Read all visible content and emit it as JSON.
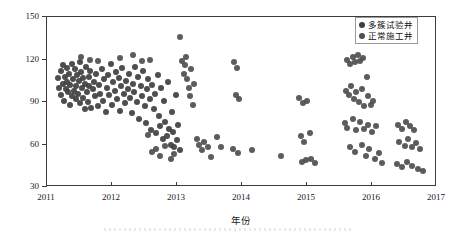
{
  "chart_data": {
    "type": "scatter",
    "title": "",
    "xlabel": "年份",
    "ylabel": "压裂段长/m",
    "xlim": [
      2011,
      2017
    ],
    "ylim": [
      30,
      150
    ],
    "xticks": [
      "2011",
      "2012",
      "2013",
      "2014",
      "2015",
      "2016",
      "2017"
    ],
    "xtick_values": [
      2011,
      2012,
      2013,
      2014,
      2015,
      2016,
      2017
    ],
    "yticks": [
      "30",
      "60",
      "90",
      "120",
      "150"
    ],
    "ytick_values": [
      30,
      60,
      90,
      120,
      150
    ],
    "grid": false,
    "legend_position": "top-right",
    "marker": {
      "shape": "circle",
      "size_px": 6,
      "color": "#4a4a4a",
      "opacity": 0.92
    },
    "series": [
      {
        "name": "多簇试验井",
        "color": "#3f3f3f",
        "points": [
          [
            2011.17,
            107
          ],
          [
            2011.19,
            100
          ],
          [
            2011.21,
            112
          ],
          [
            2011.22,
            95
          ],
          [
            2011.24,
            103
          ],
          [
            2011.25,
            116
          ],
          [
            2011.26,
            91
          ],
          [
            2011.28,
            108
          ],
          [
            2011.29,
            99
          ],
          [
            2011.3,
            114
          ],
          [
            2011.31,
            104
          ],
          [
            2011.33,
            97
          ],
          [
            2011.34,
            110
          ],
          [
            2011.35,
            88
          ],
          [
            2011.36,
            102
          ],
          [
            2011.38,
            117
          ],
          [
            2011.39,
            94
          ],
          [
            2011.4,
            106
          ],
          [
            2011.41,
            98
          ],
          [
            2011.43,
            113
          ],
          [
            2011.44,
            101
          ],
          [
            2011.45,
            92
          ],
          [
            2011.46,
            109
          ],
          [
            2011.48,
            96
          ],
          [
            2011.49,
            105
          ],
          [
            2011.5,
            118
          ],
          [
            2011.51,
            89
          ],
          [
            2011.53,
            111
          ],
          [
            2011.54,
            100
          ],
          [
            2011.55,
            93
          ],
          [
            2011.56,
            107
          ],
          [
            2011.58,
            85
          ],
          [
            2011.59,
            103
          ],
          [
            2011.6,
            115
          ],
          [
            2011.61,
            97
          ],
          [
            2011.63,
            90
          ],
          [
            2011.64,
            108
          ],
          [
            2011.65,
            101
          ],
          [
            2011.66,
            112
          ],
          [
            2011.68,
            86
          ],
          [
            2011.7,
            99
          ],
          [
            2011.72,
            104
          ],
          [
            2011.74,
            94
          ],
          [
            2011.76,
            110
          ],
          [
            2011.78,
            87
          ],
          [
            2011.8,
            102
          ],
          [
            2011.82,
            96
          ],
          [
            2011.84,
            113
          ],
          [
            2011.86,
            91
          ],
          [
            2011.88,
            106
          ],
          [
            2011.9,
            83
          ],
          [
            2011.92,
            100
          ],
          [
            2011.94,
            109
          ],
          [
            2011.96,
            95
          ],
          [
            2011.98,
            117
          ],
          [
            2012.0,
            88
          ],
          [
            2012.02,
            104
          ],
          [
            2012.04,
            98
          ],
          [
            2012.06,
            111
          ],
          [
            2012.08,
            92
          ],
          [
            2012.1,
            107
          ],
          [
            2012.12,
            84
          ],
          [
            2012.14,
            101
          ],
          [
            2012.16,
            114
          ],
          [
            2012.18,
            96
          ],
          [
            2012.2,
            89
          ],
          [
            2012.22,
            105
          ],
          [
            2012.24,
            99
          ],
          [
            2012.26,
            110
          ],
          [
            2012.28,
            93
          ],
          [
            2012.3,
            82
          ],
          [
            2012.32,
            103
          ],
          [
            2012.34,
            97
          ],
          [
            2012.36,
            115
          ],
          [
            2012.38,
            90
          ],
          [
            2012.4,
            108
          ],
          [
            2012.42,
            78
          ],
          [
            2012.44,
            101
          ],
          [
            2012.46,
            94
          ],
          [
            2012.48,
            112
          ],
          [
            2012.5,
            87
          ],
          [
            2012.52,
            75
          ],
          [
            2012.54,
            99
          ],
          [
            2012.56,
            106
          ],
          [
            2012.58,
            92
          ],
          [
            2012.6,
            70
          ],
          [
            2012.62,
            102
          ],
          [
            2012.64,
            85
          ],
          [
            2012.66,
            96
          ],
          [
            2012.68,
            68
          ],
          [
            2012.7,
            109
          ],
          [
            2012.72,
            80
          ],
          [
            2012.74,
            73
          ],
          [
            2012.76,
            100
          ],
          [
            2012.78,
            64
          ],
          [
            2012.8,
            91
          ],
          [
            2012.82,
            76
          ],
          [
            2012.84,
            66
          ],
          [
            2012.86,
            104
          ],
          [
            2012.88,
            71
          ],
          [
            2012.9,
            60
          ],
          [
            2012.92,
            83
          ],
          [
            2012.94,
            69
          ],
          [
            2012.96,
            58
          ],
          [
            2012.98,
            95
          ],
          [
            2013.0,
            63
          ],
          [
            2013.02,
            74
          ],
          [
            2013.04,
            56
          ]
        ]
      },
      {
        "name": "正常施工井",
        "color": "#4e4e4e",
        "points": [
          [
            2011.52,
            122
          ],
          [
            2011.66,
            120
          ],
          [
            2011.78,
            119
          ],
          [
            2012.12,
            121
          ],
          [
            2012.33,
            123
          ],
          [
            2012.46,
            119
          ],
          [
            2012.58,
            120
          ],
          [
            2012.55,
            67
          ],
          [
            2012.62,
            55
          ],
          [
            2012.68,
            57
          ],
          [
            2012.74,
            52
          ],
          [
            2012.82,
            59
          ],
          [
            2012.9,
            50
          ],
          [
            2012.96,
            53
          ],
          [
            2013.04,
            136
          ],
          [
            2013.08,
            119
          ],
          [
            2013.12,
            116
          ],
          [
            2013.14,
            122
          ],
          [
            2013.1,
            110
          ],
          [
            2013.16,
            106
          ],
          [
            2013.18,
            100
          ],
          [
            2013.2,
            94
          ],
          [
            2013.22,
            113
          ],
          [
            2013.24,
            88
          ],
          [
            2013.26,
            103
          ],
          [
            2013.3,
            64
          ],
          [
            2013.34,
            60
          ],
          [
            2013.38,
            56
          ],
          [
            2013.42,
            62
          ],
          [
            2013.48,
            58
          ],
          [
            2013.52,
            51
          ],
          [
            2013.62,
            65
          ],
          [
            2013.68,
            58
          ],
          [
            2013.88,
            118
          ],
          [
            2013.92,
            114
          ],
          [
            2013.9,
            95
          ],
          [
            2013.96,
            92
          ],
          [
            2013.86,
            57
          ],
          [
            2013.94,
            54
          ],
          [
            2014.16,
            56
          ],
          [
            2014.6,
            52
          ],
          [
            2014.88,
            93
          ],
          [
            2014.94,
            89
          ],
          [
            2015.0,
            91
          ],
          [
            2014.9,
            66
          ],
          [
            2014.96,
            62
          ],
          [
            2015.04,
            68
          ],
          [
            2014.92,
            48
          ],
          [
            2014.98,
            49
          ],
          [
            2015.06,
            50
          ],
          [
            2015.12,
            47
          ],
          [
            2015.62,
            120
          ],
          [
            2015.66,
            117
          ],
          [
            2015.7,
            122
          ],
          [
            2015.74,
            118
          ],
          [
            2015.78,
            123
          ],
          [
            2015.82,
            119
          ],
          [
            2015.86,
            121
          ],
          [
            2015.92,
            108
          ],
          [
            2015.6,
            98
          ],
          [
            2015.64,
            95
          ],
          [
            2015.68,
            101
          ],
          [
            2015.72,
            92
          ],
          [
            2015.76,
            97
          ],
          [
            2015.8,
            90
          ],
          [
            2015.84,
            99
          ],
          [
            2015.88,
            87
          ],
          [
            2015.94,
            94
          ],
          [
            2015.98,
            88
          ],
          [
            2016.02,
            91
          ],
          [
            2015.58,
            75
          ],
          [
            2015.62,
            72
          ],
          [
            2015.7,
            78
          ],
          [
            2015.76,
            70
          ],
          [
            2015.82,
            76
          ],
          [
            2015.88,
            71
          ],
          [
            2015.94,
            74
          ],
          [
            2016.0,
            69
          ],
          [
            2016.06,
            73
          ],
          [
            2015.66,
            58
          ],
          [
            2015.74,
            55
          ],
          [
            2015.84,
            60
          ],
          [
            2015.9,
            52
          ],
          [
            2015.96,
            57
          ],
          [
            2016.04,
            50
          ],
          [
            2016.1,
            54
          ],
          [
            2016.16,
            47
          ],
          [
            2016.4,
            74
          ],
          [
            2016.46,
            71
          ],
          [
            2016.52,
            76
          ],
          [
            2016.58,
            73
          ],
          [
            2016.64,
            70
          ],
          [
            2016.42,
            62
          ],
          [
            2016.5,
            59
          ],
          [
            2016.56,
            64
          ],
          [
            2016.62,
            58
          ],
          [
            2016.68,
            61
          ],
          [
            2016.74,
            57
          ],
          [
            2016.38,
            46
          ],
          [
            2016.46,
            44
          ],
          [
            2016.54,
            48
          ],
          [
            2016.62,
            45
          ],
          [
            2016.7,
            43
          ],
          [
            2016.78,
            41
          ]
        ]
      }
    ]
  },
  "axes": {
    "y_label": "压裂段长/m",
    "x_label": "年份"
  },
  "legend": {
    "items": [
      {
        "label": "多簇试验井",
        "color": "#3f3f3f"
      },
      {
        "label": "正常施工井",
        "color": "#4e4e4e"
      }
    ]
  }
}
